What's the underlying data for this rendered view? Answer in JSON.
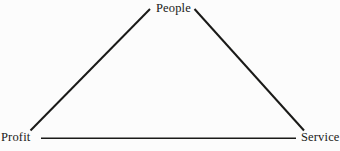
{
  "diagram": {
    "type": "triangle",
    "title": "",
    "background_color": "#fcfcfc",
    "line_color": "#1a1a18",
    "text_color": "#1a1a18",
    "vertices": [
      {
        "id": "people",
        "label": "People",
        "position": "apex"
      },
      {
        "id": "profit",
        "label": "Profit",
        "position": "bottom-left"
      },
      {
        "id": "service",
        "label": "Service",
        "position": "bottom-right"
      }
    ],
    "edges": [
      {
        "id": "profit-people",
        "from": "profit",
        "to": "people"
      },
      {
        "id": "people-service",
        "from": "people",
        "to": "service"
      },
      {
        "id": "profit-service",
        "from": "profit",
        "to": "service"
      }
    ]
  }
}
